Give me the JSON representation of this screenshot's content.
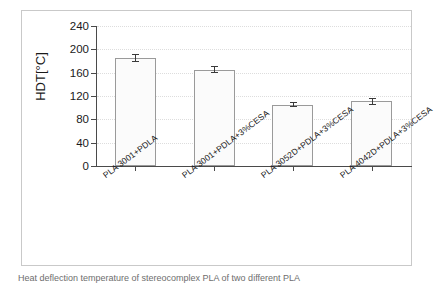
{
  "chart_data": {
    "type": "bar",
    "title": "",
    "xlabel": "",
    "ylabel": "HDT[°C]",
    "ylim": [
      0,
      240
    ],
    "yticks": [
      240,
      200,
      160,
      120,
      80,
      40,
      0
    ],
    "grid": true,
    "legend": null,
    "categories": [
      "PLA 3001+PDLA",
      "PLA 3001+PDLA+3%CESA",
      "PLA 3052D+PDLA+3%CESA",
      "PLA 4042D+PDLA+3%CESA"
    ],
    "values": [
      185,
      165,
      105,
      111
    ],
    "errors": [
      7,
      6,
      4,
      6
    ],
    "series": [
      {
        "name": "HDT",
        "values": [
          185,
          165,
          105,
          111
        ],
        "errors": [
          7,
          6,
          4,
          6
        ]
      }
    ]
  },
  "caption": {
    "text": "Heat deflection temperature of stereocomplex PLA of two different PLA"
  }
}
